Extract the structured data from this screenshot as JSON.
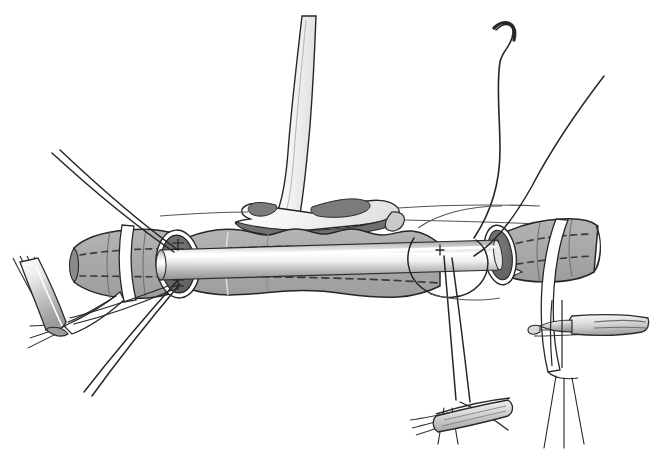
{
  "illustration": {
    "title": "Tracheal resection with cross-field endotracheal intubation",
    "domain": "surgical-line-drawing",
    "canvas": {
      "width": 652,
      "height": 456,
      "background": "#ffffff"
    },
    "palette": {
      "outline": "#1a1a1a",
      "trachea_fill": "#a9a9a9",
      "trachea_fill_light": "#b8b8b8",
      "lumen_dark": "#6e6e6e",
      "lumen_shadow": "#5c5c5c",
      "cartilage_light": "#f2f2f2",
      "cartilage_shadow": "#8f8f8f",
      "tape_white": "#ffffff",
      "instrument_light": "#fafafa",
      "instrument_mid": "#d0d0d0",
      "instrument_dark": "#9a9a9a",
      "tube_highlight": "#ffffff",
      "tube_body": "#c9c9c9",
      "suture_thread": "#2b2b2b"
    },
    "parts": [
      {
        "id": "larynx-thyroid-cartilage",
        "label": "Larynx / thyroid cartilage",
        "region": "top-center"
      },
      {
        "id": "cricoid-flare",
        "label": "Cricoid flare / laryngeal base",
        "region": "center-top"
      },
      {
        "id": "proximal-trachea",
        "label": "Proximal tracheal segment",
        "region": "left-center"
      },
      {
        "id": "distal-trachea",
        "label": "Distal tracheal segment",
        "region": "right-center"
      },
      {
        "id": "resected-specimen",
        "label": "Resected tracheal specimen",
        "region": "center"
      },
      {
        "id": "proximal-lumen",
        "label": "Proximal cut lumen (elliptical opening)",
        "region": "left-center"
      },
      {
        "id": "distal-lumen",
        "label": "Distal cut lumen (elliptical opening)",
        "region": "right-center"
      },
      {
        "id": "cross-field-endotracheal-tube",
        "label": "Cross-field endotracheal tube",
        "region": "center-right"
      },
      {
        "id": "traction-sutures-upper-left",
        "label": "Upper-left traction suture pair",
        "region": "left"
      },
      {
        "id": "traction-sutures-lower-left",
        "label": "Lower-left traction suture pair",
        "region": "left-bottom"
      },
      {
        "id": "suture-with-needle",
        "label": "Suture with curved needle",
        "region": "top-right"
      },
      {
        "id": "anastomotic-sutures",
        "label": "Anastomotic sutures",
        "region": "center-right"
      },
      {
        "id": "umbilical-tape-left",
        "label": "Encircling tape, proximal",
        "region": "left-center"
      },
      {
        "id": "umbilical-tape-right",
        "label": "Encircling tape, distal",
        "region": "right"
      },
      {
        "id": "forceps-left",
        "label": "Tissue forceps, left",
        "region": "left-bottom"
      },
      {
        "id": "forceps-bottom",
        "label": "Tissue forceps, bottom center",
        "region": "bottom-center"
      },
      {
        "id": "forceps-right",
        "label": "Tissue forceps, right",
        "region": "right-bottom"
      }
    ],
    "annotations": {
      "visible_text": [],
      "labels_shown": false,
      "caption": ""
    },
    "counts": {
      "forceps": 3,
      "suture_threads": 7,
      "needles": 1,
      "tracheal_lumens_exposed": 2,
      "encircling_tapes": 2,
      "dashed_guide_lines": 2
    }
  }
}
